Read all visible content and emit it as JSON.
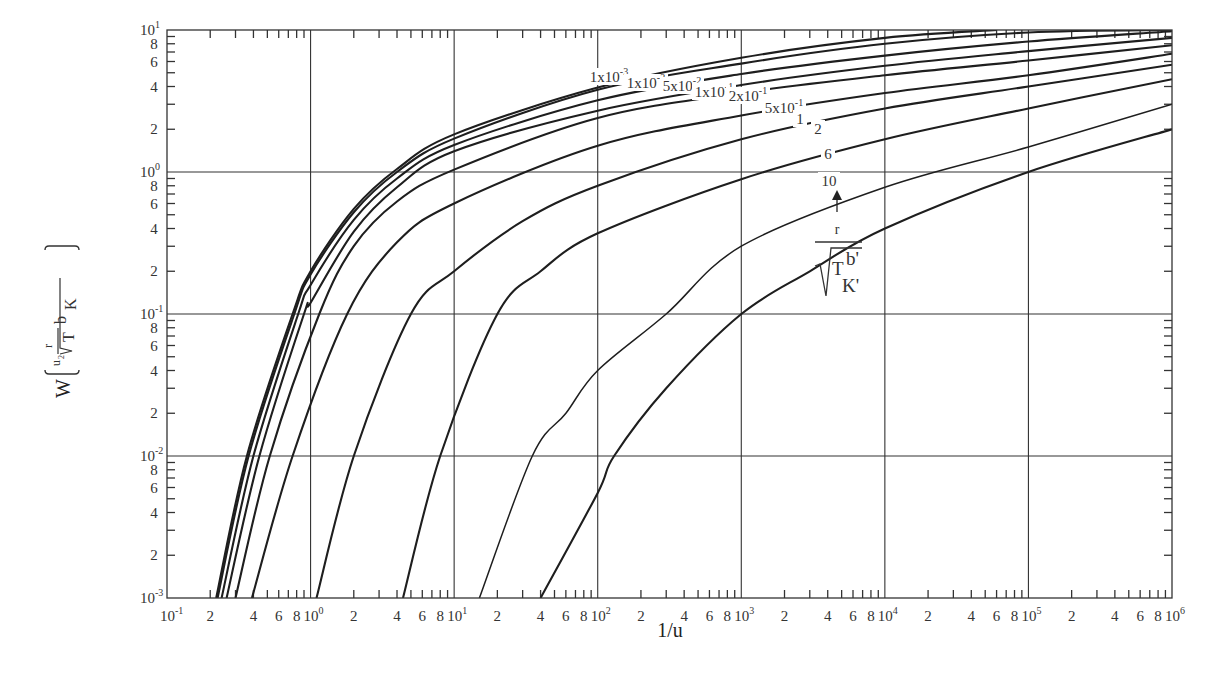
{
  "chart_data": {
    "type": "line",
    "title": "",
    "xlabel": "1/u",
    "ylabel": "W(u, r/√(T b'/K'))",
    "xscale": "log",
    "yscale": "log",
    "xlim": [
      0.1,
      1000000
    ],
    "ylim": [
      0.001,
      10
    ],
    "grid": "major decades",
    "x_ticks": [
      "10^-1",
      "2",
      "4",
      "6",
      "8",
      "10^0",
      "2",
      "4",
      "6",
      "8",
      "10^1",
      "2",
      "4",
      "6",
      "8",
      "10^2",
      "2",
      "4",
      "6",
      "8",
      "10^3",
      "2",
      "4",
      "6",
      "8",
      "10^4",
      "2",
      "4",
      "6",
      "8",
      "10^5",
      "2",
      "4",
      "6",
      "8",
      "10^6"
    ],
    "y_ticks": [
      "10^-3",
      "2",
      "4",
      "6",
      "8",
      "10^-2",
      "2",
      "4",
      "6",
      "8",
      "10^-1",
      "2",
      "4",
      "6",
      "8",
      "10^0",
      "2",
      "4",
      "6",
      "8",
      "10^1"
    ],
    "parameter_label": "r/√(T b'/K')",
    "series": [
      {
        "name": "1x10^-3",
        "points": [
          [
            0.22,
            0.001
          ],
          [
            0.36,
            0.01
          ],
          [
            0.75,
            0.1
          ],
          [
            1.0,
            0.2
          ],
          [
            2,
            0.55
          ],
          [
            4,
            1.05
          ],
          [
            10,
            1.84
          ],
          [
            100,
            3.93
          ],
          [
            1000,
            6.37
          ],
          [
            10000,
            8.8
          ],
          [
            60000,
            10
          ]
        ]
      },
      {
        "name": "1x10^-2",
        "points": [
          [
            0.225,
            0.001
          ],
          [
            0.37,
            0.01
          ],
          [
            0.77,
            0.1
          ],
          [
            1.0,
            0.19
          ],
          [
            2,
            0.52
          ],
          [
            4,
            1.0
          ],
          [
            10,
            1.72
          ],
          [
            100,
            3.8
          ],
          [
            1000,
            5.8
          ],
          [
            10000,
            8.0
          ],
          [
            100000,
            9.6
          ],
          [
            1000000,
            10
          ]
        ]
      },
      {
        "name": "5x10^-2",
        "points": [
          [
            0.24,
            0.001
          ],
          [
            0.4,
            0.01
          ],
          [
            0.82,
            0.1
          ],
          [
            1.0,
            0.16
          ],
          [
            2,
            0.46
          ],
          [
            4,
            0.9
          ],
          [
            10,
            1.55
          ],
          [
            100,
            3.2
          ],
          [
            1000,
            4.9
          ],
          [
            10000,
            6.6
          ],
          [
            100000,
            8.3
          ],
          [
            1000000,
            9.8
          ]
        ]
      },
      {
        "name": "1x10^-1",
        "points": [
          [
            0.26,
            0.001
          ],
          [
            0.44,
            0.01
          ],
          [
            0.9,
            0.1
          ],
          [
            1.0,
            0.12
          ],
          [
            2,
            0.38
          ],
          [
            4,
            0.78
          ],
          [
            10,
            1.4
          ],
          [
            100,
            2.7
          ],
          [
            1000,
            4.1
          ],
          [
            10000,
            5.6
          ],
          [
            100000,
            7.1
          ],
          [
            1000000,
            8.8
          ]
        ]
      },
      {
        "name": "2x10^-1",
        "points": [
          [
            0.3,
            0.001
          ],
          [
            0.52,
            0.01
          ],
          [
            1.15,
            0.1
          ],
          [
            2,
            0.3
          ],
          [
            4,
            0.62
          ],
          [
            10,
            1.04
          ],
          [
            100,
            2.4
          ],
          [
            1000,
            3.6
          ],
          [
            10000,
            4.8
          ],
          [
            100000,
            6.1
          ],
          [
            1000000,
            7.8
          ]
        ]
      },
      {
        "name": "5x10^-1",
        "points": [
          [
            0.39,
            0.001
          ],
          [
            0.75,
            0.01
          ],
          [
            1.8,
            0.1
          ],
          [
            4,
            0.32
          ],
          [
            10,
            0.6
          ],
          [
            100,
            1.53
          ],
          [
            1000,
            2.5
          ],
          [
            10000,
            3.6
          ],
          [
            100000,
            4.8
          ],
          [
            1000000,
            6.8
          ]
        ]
      },
      {
        "name": "1",
        "points": [
          [
            1.1,
            0.001
          ],
          [
            2.0,
            0.01
          ],
          [
            5,
            0.1
          ],
          [
            10,
            0.2
          ],
          [
            30,
            0.45
          ],
          [
            100,
            0.8
          ],
          [
            1000,
            1.7
          ],
          [
            10000,
            2.8
          ],
          [
            100000,
            4.0
          ],
          [
            1000000,
            5.7
          ]
        ]
      },
      {
        "name": "2",
        "points": [
          [
            4.4,
            0.001
          ],
          [
            8,
            0.01
          ],
          [
            20,
            0.1
          ],
          [
            40,
            0.2
          ],
          [
            100,
            0.37
          ],
          [
            1000,
            0.89
          ],
          [
            10000,
            1.7
          ],
          [
            100000,
            2.8
          ],
          [
            1000000,
            4.5
          ]
        ]
      },
      {
        "name": "6",
        "points": [
          [
            15,
            0.001
          ],
          [
            35,
            0.01
          ],
          [
            60,
            0.02
          ],
          [
            100,
            0.04
          ],
          [
            300,
            0.1
          ],
          [
            1000,
            0.3
          ],
          [
            10000,
            0.78
          ],
          [
            100000,
            1.5
          ],
          [
            1000000,
            3.0
          ]
        ]
      },
      {
        "name": "10",
        "points": [
          [
            40,
            0.001
          ],
          [
            100,
            0.0055
          ],
          [
            130,
            0.01
          ],
          [
            300,
            0.03
          ],
          [
            1000,
            0.1
          ],
          [
            3000,
            0.2
          ],
          [
            10000,
            0.4
          ],
          [
            100000,
            1.0
          ],
          [
            1000000,
            2.0
          ]
        ]
      }
    ],
    "curve_labels": [
      {
        "text": "1x10",
        "sup": "-3",
        "x": 609,
        "y": 82
      },
      {
        "text": "1x10",
        "sup": "-2",
        "x": 646,
        "y": 88
      },
      {
        "text": "5x10",
        "sup": "-2",
        "x": 682,
        "y": 91
      },
      {
        "text": "1x10",
        "sup": "-1",
        "x": 714,
        "y": 97
      },
      {
        "text": "2x10",
        "sup": "-1",
        "x": 748,
        "y": 101
      },
      {
        "text": "5x10",
        "sup": "-1",
        "x": 784,
        "y": 113
      },
      {
        "text": "1",
        "sup": "",
        "x": 800,
        "y": 124
      },
      {
        "text": "2",
        "sup": "",
        "x": 818,
        "y": 134
      },
      {
        "text": "6",
        "sup": "",
        "x": 828,
        "y": 159
      },
      {
        "text": "10",
        "sup": "",
        "x": 829,
        "y": 186
      }
    ]
  },
  "annotation": {
    "numerator": "r",
    "root_main": "T",
    "root_sup": "b'",
    "root_sub": "K'"
  },
  "y_title": {
    "W": "W",
    "u": "u",
    "u_sub": "2",
    "r": "r",
    "T": "T",
    "b": "b",
    "K": "K"
  }
}
